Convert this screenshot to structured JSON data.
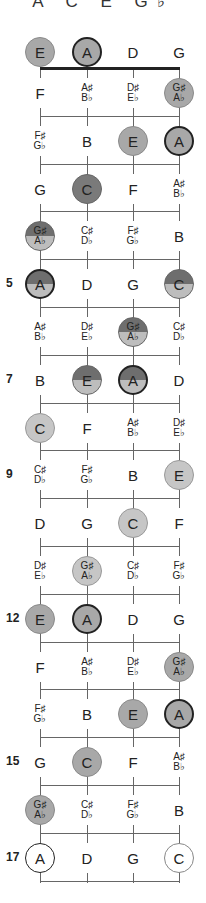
{
  "title": "A C E G♭",
  "strings": [
    "E",
    "A",
    "D",
    "G"
  ],
  "colors": {
    "gray": "#a8a8a8",
    "dark": "#7a7a7a",
    "half_top": "#6e6e6e",
    "half_bottom": "#bdbdbd",
    "light": "#c6c6c6",
    "ring": "#222222",
    "line": "#666666"
  },
  "fret_numbers": [
    {
      "fret": 5,
      "label": "5"
    },
    {
      "fret": 7,
      "label": "7"
    },
    {
      "fret": 9,
      "label": "9"
    },
    {
      "fret": 12,
      "label": "12"
    },
    {
      "fret": 15,
      "label": "15"
    },
    {
      "fret": 17,
      "label": "17"
    }
  ],
  "rows": [
    {
      "fret": 0,
      "notes": [
        {
          "n1": "E",
          "style": "gray"
        },
        {
          "n1": "A",
          "style": "gray-ring"
        },
        {
          "n1": "D"
        },
        {
          "n1": "G"
        }
      ]
    },
    {
      "fret": 1,
      "notes": [
        {
          "n1": "F"
        },
        {
          "n1": "A♯",
          "n2": "B♭"
        },
        {
          "n1": "D♯",
          "n2": "E♭"
        },
        {
          "n1": "G♯",
          "n2": "A♭",
          "style": "gray"
        }
      ]
    },
    {
      "fret": 2,
      "notes": [
        {
          "n1": "F♯",
          "n2": "G♭"
        },
        {
          "n1": "B"
        },
        {
          "n1": "E",
          "style": "gray"
        },
        {
          "n1": "A",
          "style": "gray-ring"
        }
      ]
    },
    {
      "fret": 3,
      "notes": [
        {
          "n1": "G"
        },
        {
          "n1": "C",
          "style": "dark"
        },
        {
          "n1": "F"
        },
        {
          "n1": "A♯",
          "n2": "B♭"
        }
      ]
    },
    {
      "fret": 4,
      "notes": [
        {
          "n1": "G♯",
          "n2": "A♭",
          "style": "half"
        },
        {
          "n1": "C♯",
          "n2": "D♭"
        },
        {
          "n1": "F♯",
          "n2": "G♭"
        },
        {
          "n1": "B"
        }
      ]
    },
    {
      "fret": 5,
      "notes": [
        {
          "n1": "A",
          "style": "half-ring"
        },
        {
          "n1": "D"
        },
        {
          "n1": "G"
        },
        {
          "n1": "C",
          "style": "half"
        }
      ]
    },
    {
      "fret": 6,
      "notes": [
        {
          "n1": "A♯",
          "n2": "B♭"
        },
        {
          "n1": "D♯",
          "n2": "E♭"
        },
        {
          "n1": "G♯",
          "n2": "A♭",
          "style": "half"
        },
        {
          "n1": "C♯",
          "n2": "D♭"
        }
      ]
    },
    {
      "fret": 7,
      "notes": [
        {
          "n1": "B"
        },
        {
          "n1": "E",
          "style": "half"
        },
        {
          "n1": "A",
          "style": "half-ring"
        },
        {
          "n1": "D"
        }
      ]
    },
    {
      "fret": 8,
      "notes": [
        {
          "n1": "C",
          "style": "light"
        },
        {
          "n1": "F"
        },
        {
          "n1": "A♯",
          "n2": "B♭"
        },
        {
          "n1": "D♯",
          "n2": "E♭"
        }
      ]
    },
    {
      "fret": 9,
      "notes": [
        {
          "n1": "C♯",
          "n2": "D♭"
        },
        {
          "n1": "F♯",
          "n2": "G♭"
        },
        {
          "n1": "B"
        },
        {
          "n1": "E",
          "style": "light"
        }
      ]
    },
    {
      "fret": 10,
      "notes": [
        {
          "n1": "D"
        },
        {
          "n1": "G"
        },
        {
          "n1": "C",
          "style": "light"
        },
        {
          "n1": "F"
        }
      ]
    },
    {
      "fret": 11,
      "notes": [
        {
          "n1": "D♯",
          "n2": "E♭"
        },
        {
          "n1": "G♯",
          "n2": "A♭",
          "style": "light"
        },
        {
          "n1": "C♯",
          "n2": "D♭"
        },
        {
          "n1": "F♯",
          "n2": "G♭"
        }
      ]
    },
    {
      "fret": 12,
      "notes": [
        {
          "n1": "E",
          "style": "gray"
        },
        {
          "n1": "A",
          "style": "gray-ring"
        },
        {
          "n1": "D"
        },
        {
          "n1": "G"
        }
      ]
    },
    {
      "fret": 13,
      "notes": [
        {
          "n1": "F"
        },
        {
          "n1": "A♯",
          "n2": "B♭"
        },
        {
          "n1": "D♯",
          "n2": "E♭"
        },
        {
          "n1": "G♯",
          "n2": "A♭",
          "style": "gray"
        }
      ]
    },
    {
      "fret": 14,
      "notes": [
        {
          "n1": "F♯",
          "n2": "G♭"
        },
        {
          "n1": "B"
        },
        {
          "n1": "E",
          "style": "gray"
        },
        {
          "n1": "A",
          "style": "gray-ring"
        }
      ]
    },
    {
      "fret": 15,
      "notes": [
        {
          "n1": "G"
        },
        {
          "n1": "C",
          "style": "gray"
        },
        {
          "n1": "F"
        },
        {
          "n1": "A♯",
          "n2": "B♭"
        }
      ]
    },
    {
      "fret": 16,
      "notes": [
        {
          "n1": "G♯",
          "n2": "A♭",
          "style": "gray"
        },
        {
          "n1": "C♯",
          "n2": "D♭"
        },
        {
          "n1": "F♯",
          "n2": "G♭"
        },
        {
          "n1": "B"
        }
      ]
    },
    {
      "fret": 17,
      "notes": [
        {
          "n1": "A",
          "style": "white-ring"
        },
        {
          "n1": "D"
        },
        {
          "n1": "G"
        },
        {
          "n1": "C",
          "style": "white-thin"
        }
      ]
    }
  ]
}
